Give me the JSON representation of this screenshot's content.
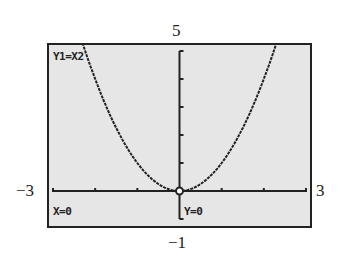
{
  "chart_data": {
    "type": "line",
    "title": "",
    "function_label": "Y1=X2",
    "equation": "y = x^2",
    "xlabel": "",
    "ylabel": "",
    "xlim": [
      -3,
      3
    ],
    "ylim": [
      -1,
      5
    ],
    "x_tick_step": 1,
    "y_tick_step": 1,
    "grid": false,
    "window_labels": {
      "xmin": "−3",
      "xmax": "3",
      "ymax": "5",
      "ymin": "−1"
    },
    "x": [
      -2.3,
      -2,
      -1.5,
      -1,
      -0.5,
      0,
      0.5,
      1,
      1.5,
      2,
      2.3
    ],
    "values": [
      5.29,
      4,
      2.25,
      1,
      0.25,
      0,
      0.25,
      1,
      2.25,
      4,
      5.29
    ],
    "trace_point": {
      "x": 0,
      "y": 0
    },
    "readout": {
      "x_text": "X=0",
      "y_text": "Y=0"
    }
  }
}
